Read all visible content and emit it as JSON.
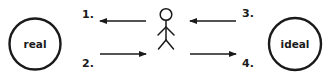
{
  "diagram": {
    "nodes": [
      {
        "id": "real",
        "label": "real",
        "shape": "circle"
      },
      {
        "id": "person",
        "label": "",
        "shape": "stick-figure"
      },
      {
        "id": "ideal",
        "label": "ideal",
        "shape": "circle"
      }
    ],
    "edges": [
      {
        "number": "1.",
        "from": "person",
        "to": "real",
        "direction": "left"
      },
      {
        "number": "2.",
        "from": "real",
        "to": "person",
        "direction": "right"
      },
      {
        "number": "3.",
        "from": "ideal",
        "to": "person",
        "direction": "left"
      },
      {
        "number": "4.",
        "from": "person",
        "to": "ideal",
        "direction": "right"
      }
    ],
    "colors": {
      "stroke": "#1a1a1a",
      "background": "#ffffff"
    }
  }
}
